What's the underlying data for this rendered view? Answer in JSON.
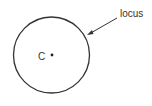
{
  "diagram": {
    "center_label": "C",
    "annotation_label": "locus",
    "stroke_color": "#333333",
    "background": "#ffffff",
    "circle": {
      "cx": 51.5,
      "cy": 55,
      "r": 38
    }
  }
}
